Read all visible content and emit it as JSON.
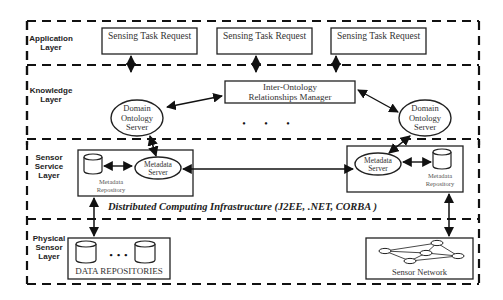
{
  "layers": [
    {
      "id": "application",
      "label": "Application Layer",
      "lines": [
        "Application",
        "Layer"
      ]
    },
    {
      "id": "knowledge",
      "label": "Knowledge Layer",
      "lines": [
        "Knowledge",
        "Layer"
      ]
    },
    {
      "id": "sensor_service",
      "label": "Sensor Service Layer",
      "lines": [
        "Sensor",
        "Service",
        "Layer"
      ]
    },
    {
      "id": "physical_sensor",
      "label": "Physical Sensor Layer",
      "lines": [
        "Physical",
        "Sensor",
        "Layer"
      ]
    }
  ],
  "application": {
    "requests": [
      "Sensing Task Request",
      "Sensing Task Request",
      "Sensing Task Request"
    ]
  },
  "knowledge": {
    "manager_lines": [
      "Inter-Ontology",
      "Relationships Manager"
    ],
    "left_server_lines": [
      "Domain",
      "Ontology",
      "Server"
    ],
    "right_server_lines": [
      "Domain",
      "Ontology",
      "Server"
    ],
    "ellipsis": "• • •"
  },
  "sensor_service": {
    "left_metadata_server": [
      "Metadata",
      "Server"
    ],
    "left_metadata_repository": [
      "Metadata",
      "Repository"
    ],
    "right_metadata_server": [
      "Metadata",
      "Server"
    ],
    "right_metadata_repository": [
      "Metadata",
      "Repository"
    ],
    "infrastructure_label": "Distributed Computing Infrastructure (J2EE, .NET, CORBA )"
  },
  "physical": {
    "data_repositories_label": "DATA REPOSITORIES",
    "ellipsis": "• • •",
    "sensor_network_label": "Sensor Network"
  }
}
